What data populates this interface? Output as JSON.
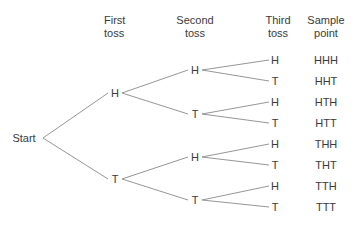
{
  "headers": {
    "first": {
      "line1": "First",
      "line2": "toss"
    },
    "second": {
      "line1": "Second",
      "line2": "toss"
    },
    "third": {
      "line1": "Third",
      "line2": "toss"
    },
    "sample": {
      "line1": "Sample",
      "line2": "point"
    }
  },
  "root": {
    "label": "Start"
  },
  "level1": [
    {
      "label": "H"
    },
    {
      "label": "T"
    }
  ],
  "level2": [
    {
      "label": "H"
    },
    {
      "label": "T"
    },
    {
      "label": "H"
    },
    {
      "label": "T"
    }
  ],
  "level3": [
    {
      "label": "H"
    },
    {
      "label": "T"
    },
    {
      "label": "H"
    },
    {
      "label": "T"
    },
    {
      "label": "H"
    },
    {
      "label": "T"
    },
    {
      "label": "H"
    },
    {
      "label": "T"
    }
  ],
  "sample_points": [
    "HHH",
    "HHT",
    "HTH",
    "HTT",
    "THH",
    "THT",
    "TTH",
    "TTT"
  ],
  "colors": {
    "line": "#8a8a8a",
    "text": "#3a3a3a"
  }
}
